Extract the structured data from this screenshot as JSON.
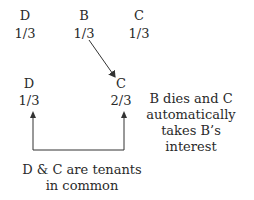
{
  "top_row": [
    {
      "label": "D",
      "share": "1/3"
    },
    {
      "label": "B",
      "share": "1/3"
    },
    {
      "label": "C",
      "share": "1/3"
    }
  ],
  "bottom_row": [
    {
      "label": "D",
      "share": "1/3"
    },
    {
      "label": "C",
      "share": "2/3"
    }
  ],
  "notes": {
    "survivorship": "B dies and C automatically takes B’s interest",
    "tenancy": "D & C are tenants in common"
  }
}
